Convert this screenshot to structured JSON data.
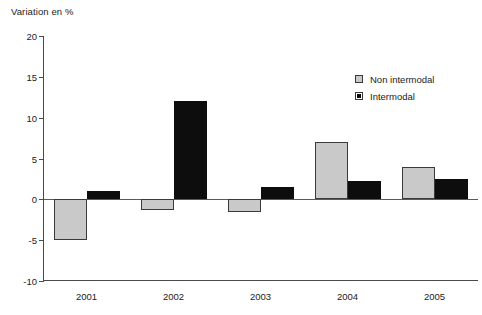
{
  "chart_data": {
    "type": "bar",
    "title": "Variation en %",
    "xlabel": "",
    "ylabel": "Variation en %",
    "categories": [
      "2001",
      "2002",
      "2003",
      "2004",
      "2005"
    ],
    "series": [
      {
        "name": "Non intermodal",
        "color": "#c9c9c9",
        "values": [
          -5.0,
          -1.3,
          -1.6,
          7.0,
          4.0
        ]
      },
      {
        "name": "Intermodal",
        "color": "#0d0d0d",
        "values": [
          1.0,
          12.0,
          1.5,
          2.3,
          2.5
        ]
      }
    ],
    "ylim": [
      -10,
      20
    ],
    "yticks": [
      20,
      15,
      10,
      5,
      0,
      -5,
      -10
    ],
    "ytick_labels": [
      "20",
      "15",
      "10",
      "5",
      "0",
      "-5",
      "-10"
    ],
    "grid": false,
    "legend_position": "top-right"
  },
  "axis": {
    "title": "Variation en %",
    "y_labels": [
      "20",
      "15",
      "10",
      "5",
      "0",
      "-5",
      "-10"
    ],
    "x_labels": [
      "2001",
      "2002",
      "2003",
      "2004",
      "2005"
    ]
  },
  "legend": {
    "items": [
      {
        "label": "Non intermodal",
        "swatch": "light-gray-square"
      },
      {
        "label": "Intermodal",
        "swatch": "black-square"
      }
    ]
  }
}
